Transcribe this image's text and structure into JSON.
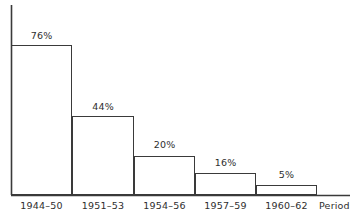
{
  "chart_data": {
    "type": "bar",
    "title": "",
    "subtitle": "",
    "xlabel": "Period",
    "ylabel": "",
    "categories": [
      "1944–50",
      "1951–53",
      "1954–56",
      "1957–59",
      "1960–62"
    ],
    "values": [
      76,
      44,
      20,
      16,
      5
    ],
    "value_labels": [
      "76%",
      "44%",
      "20%",
      "16%",
      "5%"
    ],
    "ylim": [
      0,
      76
    ],
    "grid": false,
    "legend": null,
    "legend_position": "none",
    "annotations": [],
    "axis_note": "Vertical axis drawn without tick labels; bar values printed above each bar.",
    "bar_style": {
      "fill": "#ffffff",
      "stroke": "#3a3a3a",
      "stroke_width": 1
    },
    "axis_color": "#3a3a3a",
    "background": "#ffffff",
    "text_color": "#2e2e2e"
  },
  "geometry": {
    "baseline_y": 195,
    "axis_x": 11,
    "axis_top_y": 5,
    "axis_right_x": 350,
    "bar_edges": [
      11,
      72,
      134,
      195,
      256,
      317
    ],
    "bar_tops": [
      45,
      116,
      156,
      173,
      185
    ],
    "label_y": [
      31,
      102,
      140,
      158,
      170
    ],
    "tick_label_y": 201,
    "axis_title_x": 319,
    "axis_title_y": 201
  }
}
